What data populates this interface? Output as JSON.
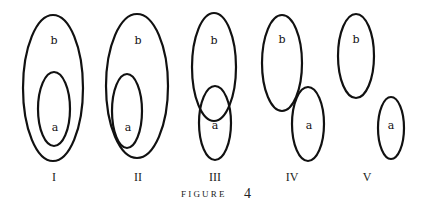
{
  "figure": {
    "caption_word": "FIGURE",
    "caption_number": "4"
  },
  "diagrams": [
    {
      "numeral": "I",
      "relation": "a contained entirely within b",
      "sets": {
        "b": "b",
        "a": "a"
      }
    },
    {
      "numeral": "II",
      "relation": "a contained within b, touching boundary",
      "sets": {
        "b": "b",
        "a": "a"
      }
    },
    {
      "numeral": "III",
      "relation": "a and b partially overlap",
      "sets": {
        "b": "b",
        "a": "a"
      }
    },
    {
      "numeral": "IV",
      "relation": "a and b externally tangent",
      "sets": {
        "b": "b",
        "a": "a"
      }
    },
    {
      "numeral": "V",
      "relation": "a and b disjoint",
      "sets": {
        "b": "b",
        "a": "a"
      }
    }
  ]
}
